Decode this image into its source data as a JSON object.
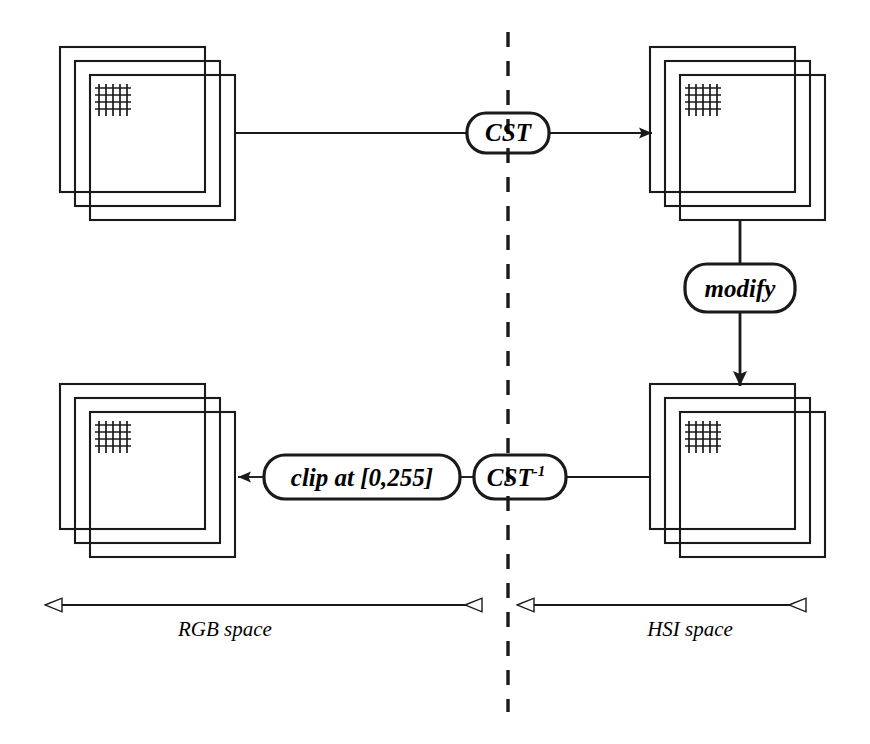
{
  "diagram": {
    "colors": {
      "stroke": "#1a1a1a",
      "fill": "#ffffff",
      "background": "#ffffff"
    },
    "nodes": [
      {
        "id": "cst",
        "label": "CST",
        "superscript": "",
        "shape": "rounded-rect",
        "x": 508,
        "y": 133,
        "w": 82,
        "h": 40
      },
      {
        "id": "modify",
        "label": "modify",
        "superscript": "",
        "shape": "rounded-rect",
        "x": 740,
        "y": 288,
        "w": 110,
        "h": 48
      },
      {
        "id": "cst-inverse",
        "label": "CST",
        "superscript": "-1",
        "shape": "rounded-rect",
        "x": 520,
        "y": 477,
        "w": 92,
        "h": 44
      },
      {
        "id": "clip",
        "label": "clip at [0,255]",
        "superscript": "",
        "shape": "rounded-rect",
        "x": 362,
        "y": 477,
        "w": 196,
        "h": 44
      }
    ],
    "image_stacks": [
      {
        "id": "rgb-input",
        "x": 90,
        "y": 75,
        "size": 145,
        "planes": 3,
        "grid_cells": 5,
        "space": "RGB"
      },
      {
        "id": "hsi-output",
        "x": 680,
        "y": 75,
        "size": 145,
        "planes": 3,
        "grid_cells": 5,
        "space": "HSI"
      },
      {
        "id": "hsi-modified",
        "x": 680,
        "y": 412,
        "size": 145,
        "planes": 3,
        "grid_cells": 5,
        "space": "HSI"
      },
      {
        "id": "rgb-result",
        "x": 90,
        "y": 412,
        "size": 145,
        "planes": 3,
        "grid_cells": 5,
        "space": "RGB"
      }
    ],
    "divider": {
      "id": "space-divider",
      "style": "dashed",
      "x": 508,
      "y_top": 32,
      "y_bottom": 712
    },
    "axes": [
      {
        "id": "rgb-space-axis",
        "label": "RGB space",
        "label_x": 225,
        "label_y": 636,
        "x_start": 43,
        "x_end": 500,
        "y": 605,
        "arrow_left": true,
        "arrow_right": true
      },
      {
        "id": "hsi-space-axis",
        "label": "HSI space",
        "label_x": 690,
        "label_y": 636,
        "x_start": 516,
        "x_end": 824,
        "y": 605,
        "arrow_left": true,
        "arrow_right": true
      }
    ],
    "connectors": [
      {
        "id": "rgb-to-cst",
        "from": "rgb-input",
        "to": "cst",
        "arrow": false
      },
      {
        "id": "cst-to-hsi",
        "from": "cst",
        "to": "hsi-output",
        "arrow": true
      },
      {
        "id": "hsi-to-modify",
        "from": "hsi-output",
        "to": "modify",
        "arrow": false
      },
      {
        "id": "modify-to-hsi-mod",
        "from": "modify",
        "to": "hsi-modified",
        "arrow": true
      },
      {
        "id": "hsi-mod-to-cstinv",
        "from": "hsi-modified",
        "to": "cst-inverse",
        "arrow": false
      },
      {
        "id": "cstinv-to-clip",
        "from": "cst-inverse",
        "to": "clip",
        "arrow": false
      },
      {
        "id": "clip-to-rgb",
        "from": "clip",
        "to": "rgb-result",
        "arrow": true
      }
    ]
  }
}
